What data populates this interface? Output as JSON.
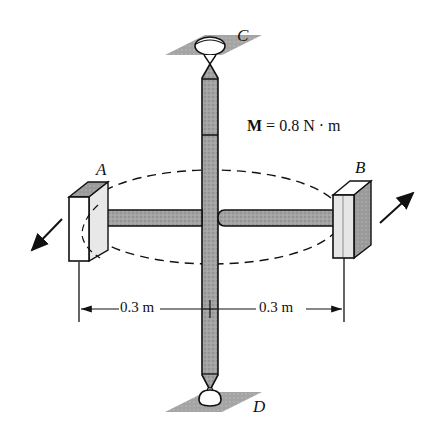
{
  "diagram": {
    "type": "mechanics-figure",
    "points": {
      "A": "A",
      "B": "B",
      "C": "C",
      "D": "D"
    },
    "moment": {
      "symbol": "M",
      "equals": "=",
      "value": "0.8",
      "unit": "N · m"
    },
    "dimensions": [
      {
        "label": "0.3 m"
      },
      {
        "label": "0.3 m"
      }
    ],
    "components": [
      "vertical-shaft-CD",
      "horizontal-rod-AB",
      "bearing-block-A",
      "bearing-block-B",
      "pivot-support-C",
      "pivot-support-D",
      "dashed-ellipse-path",
      "force-arrow-A",
      "force-arrow-B"
    ],
    "colors": {
      "rod_fill": "#9a9a9a",
      "outline": "#111111",
      "support_fill": "#8c8c8c",
      "block_fill": "#ffffff"
    }
  }
}
